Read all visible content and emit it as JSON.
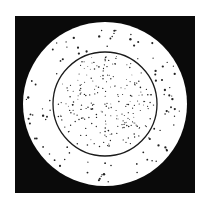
{
  "figure": {
    "background": "#ffffff",
    "frame": {
      "x": 15,
      "y": 16,
      "w": 180,
      "h": 177,
      "color": "#0a0a0a"
    },
    "outer_disk": {
      "cx": 105,
      "cy": 104,
      "r": 82,
      "color": "#ffffff"
    },
    "inner_circle": {
      "cx": 105,
      "cy": 104,
      "r": 52,
      "stroke": "#1a1a1a",
      "stroke_width": 1.3
    },
    "dot_color": "#222222",
    "inner_dot_count": 230,
    "outer_dot_count": 95,
    "seed": 7
  }
}
